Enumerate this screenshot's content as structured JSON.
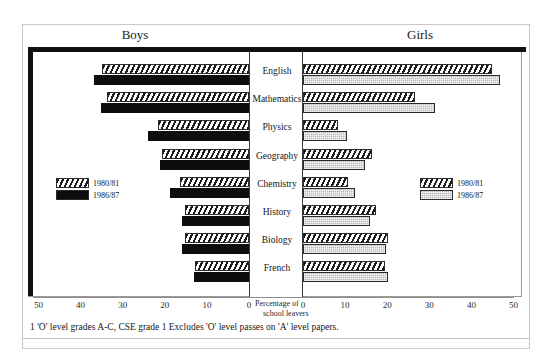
{
  "top_strip_text": "",
  "titles": {
    "boys": "Boys",
    "girls": "Girls"
  },
  "axis": {
    "caption_line1": "Percentage of",
    "caption_line2": "school leavers",
    "boys_ticks": [
      "50",
      "40",
      "30",
      "20",
      "10",
      "0"
    ],
    "girls_ticks": [
      "0",
      "10",
      "20",
      "30",
      "40",
      "50"
    ]
  },
  "legend": {
    "boys": [
      {
        "label": "1980/81",
        "swatch": "hatch"
      },
      {
        "label": "1986/87",
        "swatch": "black"
      }
    ],
    "girls": [
      {
        "label": "1980/81",
        "swatch": "hatch"
      },
      {
        "label": "1986/87",
        "swatch": "gray"
      }
    ]
  },
  "footnote": "1 'O' level grades A-C, CSE grade 1 Excludes 'O' level passes on 'A' level papers.",
  "chart_data": {
    "type": "bar",
    "orientation": "horizontal",
    "layout": "butterfly/back-to-back (Boys left, Girls right)",
    "title": "",
    "xlabel": "Percentage of school leavers",
    "ylabel": "",
    "xlim": [
      0,
      50
    ],
    "grid": false,
    "legend_position": "inside-left and inside-right",
    "categories": [
      "English",
      "Mathematics",
      "Physics",
      "Geography",
      "Chemistry",
      "History",
      "Biology",
      "French"
    ],
    "panels": [
      {
        "name": "Boys",
        "series": [
          {
            "name": "1980/81",
            "style": "hatch",
            "values": [
              35.0,
              33.8,
              21.7,
              20.7,
              16.4,
              15.2,
              15.2,
              12.9
            ]
          },
          {
            "name": "1986/87",
            "style": "black",
            "values": [
              36.7,
              35.2,
              24.0,
              21.2,
              18.8,
              16.0,
              16.0,
              13.1
            ]
          }
        ]
      },
      {
        "name": "Girls",
        "series": [
          {
            "name": "1980/81",
            "style": "hatch",
            "values": [
              45.0,
              26.7,
              8.3,
              16.4,
              10.7,
              17.4,
              20.2,
              19.5
            ]
          },
          {
            "name": "1986/87",
            "style": "gray",
            "values": [
              46.9,
              31.4,
              10.5,
              14.8,
              12.4,
              15.9,
              19.7,
              20.2
            ]
          }
        ]
      }
    ]
  }
}
